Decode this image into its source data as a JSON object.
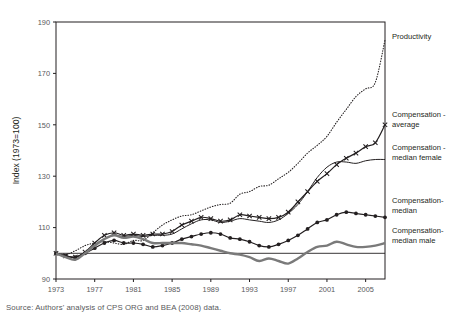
{
  "figure": {
    "title_clipped": "",
    "source": "Source: Authors' analysis of CPS ORG and BEA (2008) data."
  },
  "axes": {
    "y_title": "Index (1973=100)",
    "y_ticks": [
      "90",
      "110",
      "130",
      "150",
      "170",
      "190"
    ],
    "x_ticks": [
      "1973",
      "1977",
      "1981",
      "1985",
      "1989",
      "1993",
      "1997",
      "2001",
      "2005"
    ]
  },
  "labels": {
    "productivity": "Productivity",
    "comp_average_l1": "Compensation -",
    "comp_average_l2": "average",
    "comp_median_female_l1": "Compensation -",
    "comp_median_female_l2": "median female",
    "comp_median_l1": "Compensation-",
    "comp_median_l2": "median",
    "comp_median_male_l1": "Compensation-",
    "comp_median_male_l2": "median male"
  },
  "colors": {
    "ink": "#231f20",
    "grey": "#7a7a7a",
    "tick": "#58595b",
    "background": "#ffffff"
  },
  "chart_data": {
    "type": "line",
    "title": "",
    "xlabel": "",
    "ylabel": "Index (1973=100)",
    "xlim": [
      1973,
      2007
    ],
    "ylim": [
      90,
      190
    ],
    "grid": false,
    "legend": "right-of-plot (direct series labels)",
    "x": [
      1973,
      1974,
      1975,
      1976,
      1977,
      1978,
      1979,
      1980,
      1981,
      1982,
      1983,
      1984,
      1985,
      1986,
      1987,
      1988,
      1989,
      1990,
      1991,
      1992,
      1993,
      1994,
      1995,
      1996,
      1997,
      1998,
      1999,
      2000,
      2001,
      2002,
      2003,
      2004,
      2005,
      2006,
      2007
    ],
    "series": [
      {
        "name": "Productivity",
        "style": "dotted",
        "marker": "none",
        "color": "#231f20",
        "values": [
          100,
          99.5,
          101,
          103,
          104,
          104.5,
          104,
          103.5,
          105,
          105,
          108,
          111,
          113,
          114.5,
          115,
          116.5,
          118,
          119,
          119.5,
          123,
          124,
          126,
          126.5,
          129,
          131.5,
          135,
          139,
          142,
          145.5,
          151,
          156,
          161,
          164,
          166.5,
          183
        ]
      },
      {
        "name": "Compensation - average",
        "style": "solid",
        "marker": "x",
        "color": "#231f20",
        "values": [
          100,
          99,
          98.5,
          100.5,
          104,
          107,
          108,
          107,
          107.5,
          107,
          107.5,
          107.5,
          108.5,
          111,
          112.5,
          114,
          113.5,
          112.5,
          113,
          115,
          114.5,
          114,
          113.5,
          114,
          116,
          120,
          124,
          128,
          131,
          134.5,
          137,
          139,
          141.5,
          143,
          150
        ]
      },
      {
        "name": "Compensation - median female",
        "style": "solid-thin",
        "marker": "none",
        "color": "#231f20",
        "values": [
          100,
          99,
          98.5,
          100.5,
          103,
          105.5,
          107,
          106.5,
          107,
          106.5,
          107,
          107,
          107.5,
          109.5,
          111.5,
          113,
          113,
          112,
          112.5,
          113.5,
          113,
          112.5,
          112,
          113,
          115.5,
          119,
          124,
          129.5,
          133.5,
          135.5,
          135.5,
          135,
          136,
          136.5,
          136.5
        ]
      },
      {
        "name": "Compensation-median",
        "style": "solid",
        "marker": "circle",
        "color": "#231f20",
        "values": [
          100,
          99,
          98.5,
          100,
          102,
          104,
          105,
          104,
          104,
          103.5,
          102.5,
          103,
          104,
          105.5,
          106.5,
          107.5,
          108,
          107.5,
          106,
          105.5,
          104.5,
          103,
          102.5,
          103.5,
          105,
          107,
          109.5,
          112,
          113,
          115,
          116,
          115.5,
          115,
          114.5,
          114
        ]
      },
      {
        "name": "Compensation-median male",
        "style": "solid-thick",
        "marker": "none",
        "color": "#7a7a7a",
        "values": [
          100,
          98.5,
          97.5,
          100,
          103,
          105.5,
          107,
          106,
          106.5,
          105.5,
          104,
          104,
          104,
          104,
          103.5,
          103,
          102,
          101,
          100,
          99.5,
          98.5,
          97,
          98,
          97,
          96,
          98,
          100.5,
          102.5,
          103,
          104.5,
          103.5,
          102.5,
          102.5,
          103,
          104
        ]
      }
    ]
  }
}
